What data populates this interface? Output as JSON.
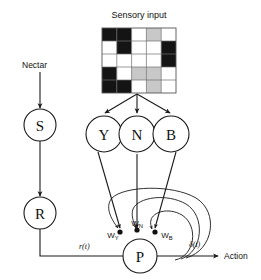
{
  "figure": {
    "title": "Sensory input",
    "background_color": "#ffffff",
    "ink_color": "#1a1a1a"
  },
  "labels": {
    "nectar": "Nectar",
    "action": "Action",
    "reward_signal": "r(t)",
    "prediction_error_signal": "δ(t)"
  },
  "sensory_grid": {
    "rows": 5,
    "cols": 5,
    "colors": {
      "black": "#141414",
      "white": "#ffffff",
      "gray": "#c8c8c8"
    },
    "cells": [
      [
        "black",
        "black",
        "white",
        "gray",
        "white"
      ],
      [
        "white",
        "black",
        "white",
        "white",
        "black"
      ],
      [
        "white",
        "white",
        "white",
        "white",
        "black"
      ],
      [
        "black",
        "white",
        "gray",
        "gray",
        "white"
      ],
      [
        "black",
        "black",
        "white",
        "gray",
        "white"
      ]
    ]
  },
  "nodes": {
    "s": "S",
    "r": "R",
    "y": "Y",
    "n": "N",
    "b": "B",
    "p": "P"
  },
  "weights": {
    "y": {
      "base": "W",
      "sub": "Y"
    },
    "n": {
      "base": "W",
      "sub": "N"
    },
    "b": {
      "base": "W",
      "sub": "B"
    }
  }
}
